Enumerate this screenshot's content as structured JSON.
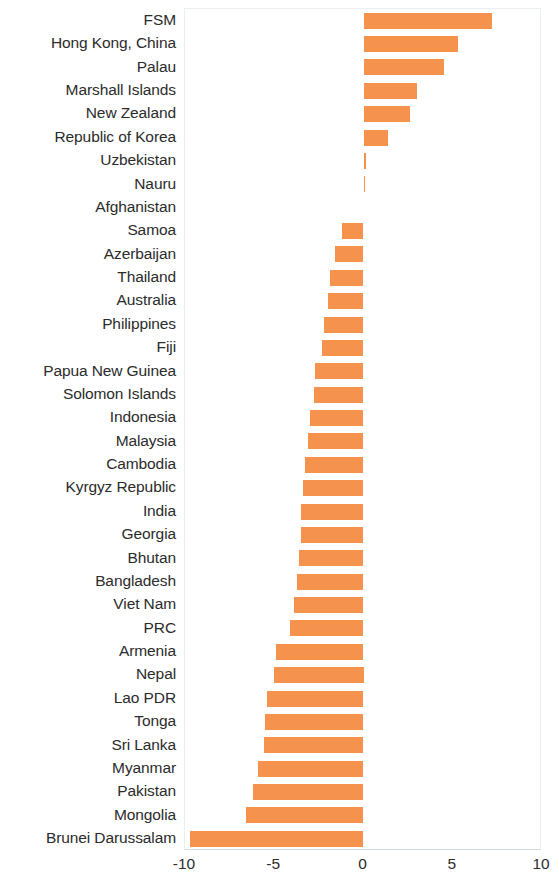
{
  "chart_data": {
    "type": "bar",
    "orientation": "horizontal",
    "title": "",
    "subtitle": "",
    "xlabel": "",
    "ylabel": "",
    "xlim": [
      -10,
      10
    ],
    "xticks": [
      -10,
      -5,
      0,
      5,
      10
    ],
    "xticklabels": [
      "-10",
      "-5",
      "0",
      "5",
      "10"
    ],
    "grid": false,
    "legend": null,
    "bar_color": "#f5934e",
    "zero_line": 0,
    "categories": [
      "FSM",
      "Hong Kong, China",
      "Palau",
      "Marshall Islands",
      "New Zealand",
      "Republic of Korea",
      "Uzbekistan",
      "Nauru",
      "Afghanistan",
      "Samoa",
      "Azerbaijan",
      "Thailand",
      "Australia",
      "Philippines",
      "Fiji",
      "Papua New Guinea",
      "Solomon Islands",
      "Indonesia",
      "Malaysia",
      "Cambodia",
      "Kyrgyz Republic",
      "India",
      "Georgia",
      "Bhutan",
      "Bangladesh",
      "Viet Nam",
      "PRC",
      "Armenia",
      "Nepal",
      "Lao PDR",
      "Tonga",
      "Sri Lanka",
      "Myanmar",
      "Pakistan",
      "Mongolia",
      "Brunei Darussalam"
    ],
    "values": [
      7.2,
      5.3,
      4.5,
      3.0,
      2.6,
      1.4,
      0.15,
      0.05,
      0.0,
      -1.2,
      -1.6,
      -1.9,
      -2.0,
      -2.2,
      -2.3,
      -2.7,
      -2.8,
      -3.0,
      -3.1,
      -3.3,
      -3.4,
      -3.5,
      -3.5,
      -3.6,
      -3.7,
      -3.9,
      -4.1,
      -4.9,
      -5.0,
      -5.4,
      -5.5,
      -5.6,
      -5.9,
      -6.2,
      -6.6,
      -9.7
    ]
  }
}
